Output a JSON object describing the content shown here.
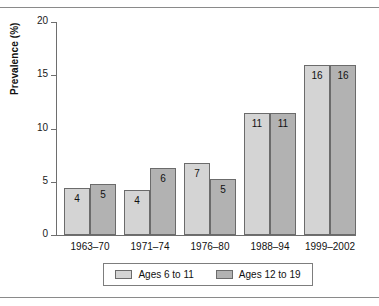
{
  "chart_data": {
    "type": "bar",
    "title": "",
    "subtitle": "",
    "xlabel": "",
    "ylabel": "Prevalence (%)",
    "ylim": [
      0,
      20
    ],
    "yticks": [
      0,
      5,
      10,
      15,
      20
    ],
    "ytick_labels": [
      "0",
      "5",
      "10",
      "15",
      "20"
    ],
    "grid": false,
    "legend_position": "bottom-center",
    "categories": [
      "1963–70",
      "1971–74",
      "1976–80",
      "1988–94",
      "1999–2002"
    ],
    "series": [
      {
        "name": "Ages 6 to 11",
        "color": "#d4d4d4",
        "values": [
          4.4,
          4.2,
          6.8,
          11.5,
          16.0
        ],
        "labels": [
          "4",
          "4",
          "7",
          "11",
          "16"
        ]
      },
      {
        "name": "Ages 12 to 19",
        "color": "#b2b2b2",
        "values": [
          4.8,
          6.3,
          5.3,
          11.5,
          16.0
        ],
        "labels": [
          "5",
          "6",
          "5",
          "11",
          "16"
        ]
      }
    ]
  },
  "legend": {
    "items": [
      {
        "label": "Ages 6 to 11",
        "color": "#d4d4d4"
      },
      {
        "label": "Ages 12 to 19",
        "color": "#b2b2b2"
      }
    ]
  }
}
